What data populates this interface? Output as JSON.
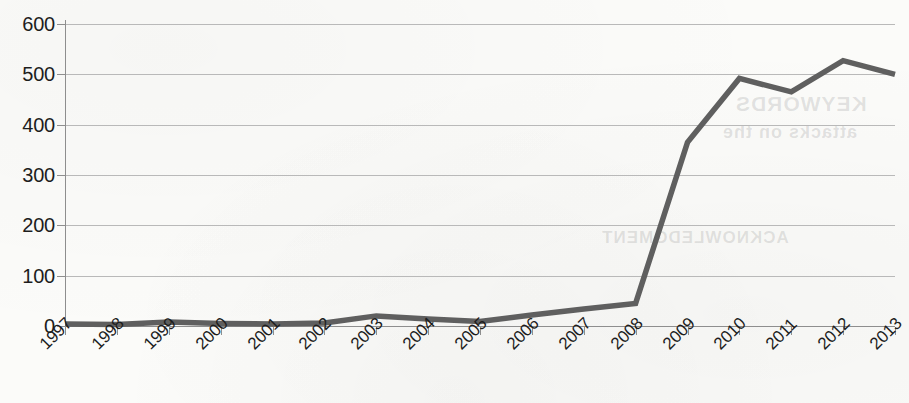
{
  "chart_data": {
    "type": "line",
    "title": "",
    "subtitle": "",
    "xlabel": "",
    "ylabel": "",
    "categories": [
      "1997",
      "1998",
      "1999",
      "2000",
      "2001",
      "2002",
      "2003",
      "2004",
      "2005",
      "2006",
      "2007",
      "2008",
      "2009",
      "2010",
      "2011",
      "2012",
      "2013"
    ],
    "series": [
      {
        "name": "Publications",
        "color": "#5f5f5f",
        "values": [
          4,
          3,
          8,
          5,
          4,
          6,
          20,
          14,
          9,
          22,
          34,
          45,
          365,
          492,
          465,
          527,
          500
        ]
      }
    ],
    "ylim": [
      0,
      600
    ],
    "ytick_values": [
      0,
      100,
      200,
      300,
      400,
      500,
      600
    ],
    "ytick_labels": [
      "0",
      "100",
      "200",
      "300",
      "400",
      "500",
      "600"
    ],
    "grid": "horizontal",
    "legend": "none",
    "x_label_rotation": -45
  },
  "bleedthrough": {
    "line_one": "KEYWORDS",
    "line_two": "attacks on the",
    "line_three": "ACKNOWLEDGMENT"
  },
  "style": {
    "line_color": "#5f5f5f",
    "grid_color": "#b9b9b9",
    "axis_color": "#8e8e8e",
    "text_color": "#1d1d1d",
    "background_color": "#fbfbf9"
  }
}
